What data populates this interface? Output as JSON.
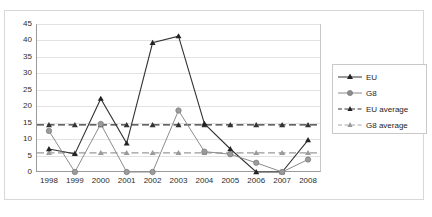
{
  "chart_data": {
    "type": "line",
    "title": "",
    "xlabel": "",
    "ylabel": "",
    "categories": [
      "1998",
      "1999",
      "2000",
      "2001",
      "2002",
      "2003",
      "2004",
      "2005",
      "2006",
      "2007",
      "2008"
    ],
    "ylim": [
      0,
      45
    ],
    "ytick_step": 5,
    "yticks": [
      "0",
      "5",
      "10",
      "15",
      "20",
      "25",
      "30",
      "35",
      "40",
      "45"
    ],
    "grid": true,
    "legend_position": "right",
    "series": [
      {
        "name": "EU",
        "style": "solid",
        "marker": "triangle",
        "color": "#333333",
        "values": [
          7.0,
          5.5,
          22.3,
          8.7,
          39.3,
          41.3,
          14.7,
          7.0,
          0.0,
          0.0,
          9.7
        ]
      },
      {
        "name": "G8",
        "style": "solid",
        "marker": "circle",
        "color": "#8c8c8c",
        "values": [
          12.5,
          0.0,
          14.6,
          0.0,
          0.0,
          18.7,
          6.2,
          5.4,
          2.8,
          0.0,
          3.8
        ]
      },
      {
        "name": "EU average",
        "style": "dashed",
        "marker": "triangle",
        "color": "#333333",
        "constant": 14.3
      },
      {
        "name": "G8 average",
        "style": "dashed",
        "marker": "triangle",
        "color": "#9a9a9a",
        "constant": 5.8
      }
    ]
  },
  "legend": {
    "items": [
      {
        "label": "EU"
      },
      {
        "label": "G8"
      },
      {
        "label": "EU average"
      },
      {
        "label": "G8 average"
      }
    ]
  }
}
